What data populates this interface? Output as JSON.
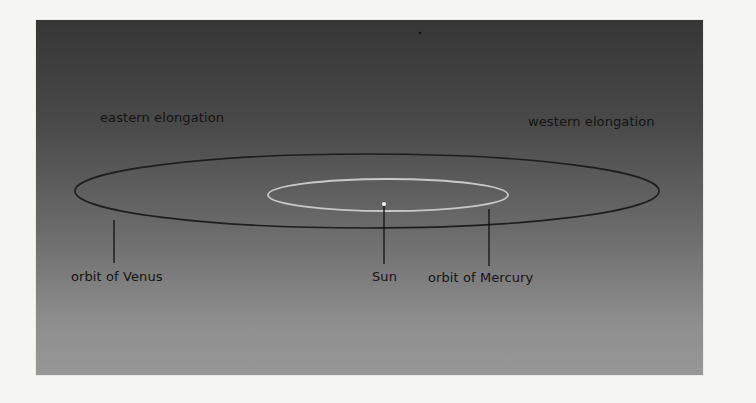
{
  "diagram": {
    "title": "",
    "labels": {
      "eastern_elongation": "eastern elongation",
      "western_elongation": "western elongation",
      "orbit_venus": "orbit of Venus",
      "sun": "Sun",
      "orbit_mercury": "orbit of Mercury"
    },
    "colors": {
      "page_background": "#f5f5f3",
      "panel_top": "#363636",
      "panel_bottom": "#979797",
      "venus_orbit": "#1e1e1e",
      "mercury_orbit": "#c8c8c8",
      "sun": "#f2f2f2",
      "leader_line": "#111111",
      "label_text": "#141414"
    },
    "elements": {
      "venus_orbit": {
        "shape": "ellipse",
        "cx": 367,
        "cy": 191,
        "rx": 292,
        "ry": 37
      },
      "mercury_orbit": {
        "shape": "ellipse",
        "cx": 388,
        "cy": 195,
        "rx": 120,
        "ry": 16
      },
      "sun": {
        "shape": "dot",
        "cx": 384,
        "cy": 204,
        "r": 2
      }
    }
  }
}
